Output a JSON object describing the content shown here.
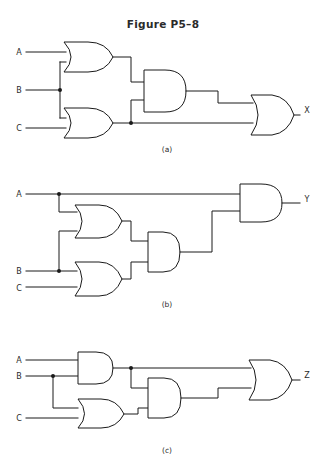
{
  "figure": {
    "title": "Figure P5–8",
    "background_color": "#ffffff",
    "ink_color": "#1a1a1a",
    "text_color": "#2b2b2b",
    "width": 326,
    "height": 470
  },
  "circuits": [
    {
      "id": "a",
      "caption": "(a)",
      "inputs": [
        "A",
        "B",
        "C"
      ],
      "output": "X",
      "gates": [
        {
          "name": "or-gate-a1",
          "type": "OR",
          "inputs": [
            "A",
            "B"
          ]
        },
        {
          "name": "or-gate-a2",
          "type": "OR",
          "inputs": [
            "B",
            "C"
          ]
        },
        {
          "name": "and-gate-a3",
          "type": "AND",
          "inputs": [
            "or-gate-a1",
            "or-gate-a2"
          ]
        },
        {
          "name": "or-gate-a4",
          "type": "OR",
          "inputs": [
            "and-gate-a3",
            "or-gate-a2"
          ],
          "output": "X"
        }
      ],
      "expression": "X = ((A+B)(B+C)) + (B+C)"
    },
    {
      "id": "b",
      "caption": "(b)",
      "inputs": [
        "A",
        "B",
        "C"
      ],
      "output": "Y",
      "gates": [
        {
          "name": "or-gate-b1",
          "type": "OR",
          "inputs": [
            "A",
            "B"
          ]
        },
        {
          "name": "or-gate-b2",
          "type": "OR",
          "inputs": [
            "B",
            "C"
          ]
        },
        {
          "name": "and-gate-b3",
          "type": "AND",
          "inputs": [
            "or-gate-b1",
            "or-gate-b2"
          ]
        },
        {
          "name": "and-gate-b4",
          "type": "AND",
          "inputs": [
            "A",
            "and-gate-b3"
          ],
          "output": "Y"
        }
      ],
      "expression": "Y = A((A+B)(B+C))"
    },
    {
      "id": "c",
      "caption": "(c)",
      "inputs": [
        "A",
        "B",
        "C"
      ],
      "output": "Z",
      "gates": [
        {
          "name": "and-gate-c1",
          "type": "AND",
          "inputs": [
            "A",
            "B"
          ]
        },
        {
          "name": "or-gate-c2",
          "type": "OR",
          "inputs": [
            "B",
            "C"
          ]
        },
        {
          "name": "and-gate-c3",
          "type": "AND",
          "inputs": [
            "and-gate-c1",
            "or-gate-c2"
          ]
        },
        {
          "name": "or-gate-c4",
          "type": "OR",
          "inputs": [
            "and-gate-c1",
            "and-gate-c3"
          ],
          "output": "Z"
        }
      ],
      "expression": "Z = (AB) + ((AB)(B+C))"
    }
  ],
  "labels": {
    "a_input_A": "A",
    "a_input_B": "B",
    "a_input_C": "C",
    "a_output_X": "X",
    "a_caption": "(a)",
    "b_input_A": "A",
    "b_input_B": "B",
    "b_input_C": "C",
    "b_output_Y": "Y",
    "b_caption": "(b)",
    "c_input_A": "A",
    "c_input_B": "B",
    "c_input_C": "C",
    "c_output_Z": "Z",
    "c_caption": "(c)"
  }
}
